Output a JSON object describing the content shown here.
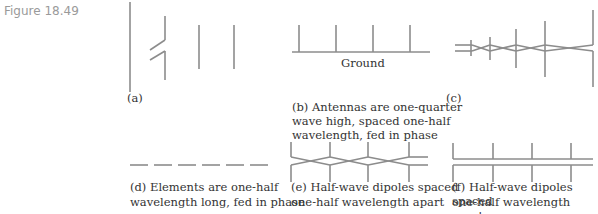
{
  "figure": {
    "number": "Figure 18.49",
    "line_color": "#8c8c8c"
  },
  "panels": {
    "a": {
      "label": "(a)",
      "caption": ""
    },
    "b": {
      "label": "(b)",
      "ground_label": "Ground",
      "caption_line1": "(b)  Antennas are one-quarter",
      "caption_line2": "wave high, spaced one-half",
      "caption_line3": "wavelength, fed in phase"
    },
    "c": {
      "label": "(c)"
    },
    "d": {
      "caption_line1": "(d)  Elements are one-half",
      "caption_line2": "wavelength long, fed in phase"
    },
    "e": {
      "caption_line1": "(e)  Half-wave dipoles spaced",
      "caption_line2": "one-half wavelength apart"
    },
    "f": {
      "caption_line1": "(f)  Half-wave dipoles spaced",
      "caption_line2": "one-half wavelength apart"
    }
  }
}
